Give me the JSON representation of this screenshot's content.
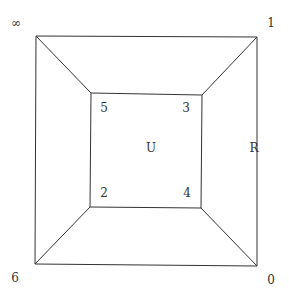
{
  "diagram": {
    "type": "planar graph (cube-like nested squares)",
    "outer_vertices": [
      {
        "id": "inf",
        "label": "∞",
        "x": 36,
        "y": 36,
        "label_x": 16,
        "label_y": 27
      },
      {
        "id": "one",
        "label": "1",
        "x": 257,
        "y": 37,
        "label_x": 271,
        "label_y": 27
      },
      {
        "id": "zero",
        "label": "0",
        "x": 257,
        "y": 266,
        "label_x": 271,
        "label_y": 284
      },
      {
        "id": "six",
        "label": "6",
        "x": 35,
        "y": 264,
        "label_x": 15,
        "label_y": 282
      }
    ],
    "inner_vertices": [
      {
        "id": "five",
        "label": "5",
        "x": 91,
        "y": 93,
        "label_x": 104,
        "label_y": 112
      },
      {
        "id": "three",
        "label": "3",
        "x": 202,
        "y": 95,
        "label_x": 186,
        "label_y": 112
      },
      {
        "id": "four",
        "label": "4",
        "x": 201,
        "y": 208,
        "label_x": 187,
        "label_y": 197
      },
      {
        "id": "two",
        "label": "2",
        "x": 90,
        "y": 207,
        "label_x": 104,
        "label_y": 197
      }
    ],
    "region_labels": [
      {
        "id": "U",
        "label": "U",
        "x": 151,
        "y": 152
      },
      {
        "id": "R",
        "label": "R",
        "x": 254,
        "y": 152
      }
    ],
    "edges": [
      [
        "inf",
        "one"
      ],
      [
        "one",
        "zero"
      ],
      [
        "zero",
        "six"
      ],
      [
        "six",
        "inf"
      ],
      [
        "five",
        "three"
      ],
      [
        "three",
        "four"
      ],
      [
        "four",
        "two"
      ],
      [
        "two",
        "five"
      ],
      [
        "inf",
        "five"
      ],
      [
        "one",
        "three"
      ],
      [
        "zero",
        "four"
      ],
      [
        "six",
        "two"
      ]
    ],
    "line_color": "#333333"
  }
}
